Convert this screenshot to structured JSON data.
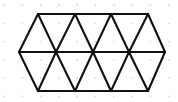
{
  "figure": {
    "canvas": {
      "width": 178,
      "height": 102,
      "background_color": "#ffffff"
    },
    "style": {
      "line_color": "#111111",
      "line_width": 2.1,
      "dot_color": "#d8d8d8",
      "dot_radius": 0.9
    },
    "dot_grid": {
      "visible": true,
      "spacing_x": 18.3,
      "spacing_y": 18.3,
      "origin_x": 4,
      "origin_y": 5,
      "columns": 10,
      "rows": 6
    },
    "geometry": {
      "row_y": {
        "top": 14,
        "middle": 52,
        "bottom": 91
      },
      "top_vertices_x": [
        38,
        75,
        111,
        148
      ],
      "middle_vertices_x": [
        19,
        56,
        93,
        129,
        165
      ],
      "bottom_vertices_x": [
        38,
        75,
        111,
        148
      ]
    },
    "segments": [
      {
        "name": "top-horizontal-edge",
        "x1": 38,
        "y1": 14,
        "x2": 148,
        "y2": 14
      },
      {
        "name": "middle-horizontal-edge",
        "x1": 19,
        "y1": 52,
        "x2": 165,
        "y2": 52
      },
      {
        "name": "bottom-horizontal-edge",
        "x1": 38,
        "y1": 91,
        "x2": 148,
        "y2": 91
      },
      {
        "name": "upper-left-outer-edge",
        "x1": 19,
        "y1": 52,
        "x2": 38,
        "y2": 14
      },
      {
        "name": "upper-diagonal-1",
        "x1": 38,
        "y1": 14,
        "x2": 56,
        "y2": 52
      },
      {
        "name": "upper-diagonal-2",
        "x1": 56,
        "y1": 52,
        "x2": 75,
        "y2": 14
      },
      {
        "name": "upper-diagonal-3",
        "x1": 75,
        "y1": 14,
        "x2": 93,
        "y2": 52
      },
      {
        "name": "upper-diagonal-4",
        "x1": 93,
        "y1": 52,
        "x2": 111,
        "y2": 14
      },
      {
        "name": "upper-diagonal-5",
        "x1": 111,
        "y1": 14,
        "x2": 129,
        "y2": 52
      },
      {
        "name": "upper-diagonal-6",
        "x1": 129,
        "y1": 52,
        "x2": 148,
        "y2": 14
      },
      {
        "name": "upper-right-outer-edge",
        "x1": 148,
        "y1": 14,
        "x2": 165,
        "y2": 52
      },
      {
        "name": "lower-left-outer-edge",
        "x1": 19,
        "y1": 52,
        "x2": 38,
        "y2": 91
      },
      {
        "name": "lower-diagonal-1",
        "x1": 38,
        "y1": 91,
        "x2": 56,
        "y2": 52
      },
      {
        "name": "lower-diagonal-2",
        "x1": 56,
        "y1": 52,
        "x2": 75,
        "y2": 91
      },
      {
        "name": "lower-diagonal-3",
        "x1": 75,
        "y1": 91,
        "x2": 93,
        "y2": 52
      },
      {
        "name": "lower-diagonal-4",
        "x1": 93,
        "y1": 52,
        "x2": 111,
        "y2": 91
      },
      {
        "name": "lower-diagonal-5",
        "x1": 111,
        "y1": 91,
        "x2": 129,
        "y2": 52
      },
      {
        "name": "lower-diagonal-6",
        "x1": 129,
        "y1": 52,
        "x2": 148,
        "y2": 91
      },
      {
        "name": "lower-right-outer-edge",
        "x1": 148,
        "y1": 91,
        "x2": 165,
        "y2": 52
      }
    ]
  }
}
